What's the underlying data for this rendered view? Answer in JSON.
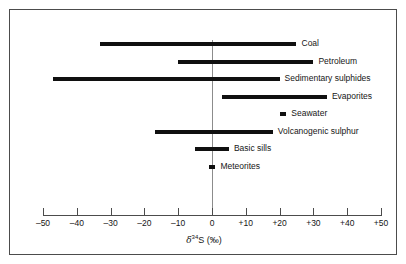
{
  "figure": {
    "background": "#ffffff",
    "frame_color": "#4c4c4c",
    "bar_color": "#101010",
    "zero_line_color": "#8c8c8c"
  },
  "axis": {
    "title_symbol": "δ",
    "title_sup": "34",
    "title_rest": "S (‰)",
    "title_full": "δ³⁴S (‰)",
    "ticks": [
      {
        "value": -50,
        "label": "–50"
      },
      {
        "value": -40,
        "label": "–40"
      },
      {
        "value": -30,
        "label": "–30"
      },
      {
        "value": -20,
        "label": "–20"
      },
      {
        "value": -10,
        "label": "–10"
      },
      {
        "value": 0,
        "label": "0"
      },
      {
        "value": 10,
        "label": "+10"
      },
      {
        "value": 20,
        "label": "+20"
      },
      {
        "value": 30,
        "label": "+30"
      },
      {
        "value": 40,
        "label": "+40"
      },
      {
        "value": 50,
        "label": "+50"
      }
    ]
  },
  "chart_data": {
    "type": "bar",
    "orientation": "horizontal",
    "subtype": "range-bars",
    "title": "",
    "xlabel": "δ³⁴S (‰)",
    "ylabel": "",
    "xlim": [
      -50,
      50
    ],
    "grid": false,
    "legend": "none",
    "categories": [
      "Coal",
      "Petroleum",
      "Sedimentary sulphides",
      "Evaporites",
      "Seawater",
      "Volcanogenic sulphur",
      "Basic sills",
      "Meteorites"
    ],
    "ranges": [
      {
        "name": "Coal",
        "min": -33,
        "max": 25
      },
      {
        "name": "Petroleum",
        "min": -10,
        "max": 30
      },
      {
        "name": "Sedimentary sulphides",
        "min": -47,
        "max": 20
      },
      {
        "name": "Evaporites",
        "min": 3,
        "max": 34
      },
      {
        "name": "Seawater",
        "min": 20,
        "max": 22
      },
      {
        "name": "Volcanogenic sulphur",
        "min": -17,
        "max": 18
      },
      {
        "name": "Basic sills",
        "min": -5,
        "max": 5
      },
      {
        "name": "Meteorites",
        "min": -1,
        "max": 1
      }
    ]
  }
}
